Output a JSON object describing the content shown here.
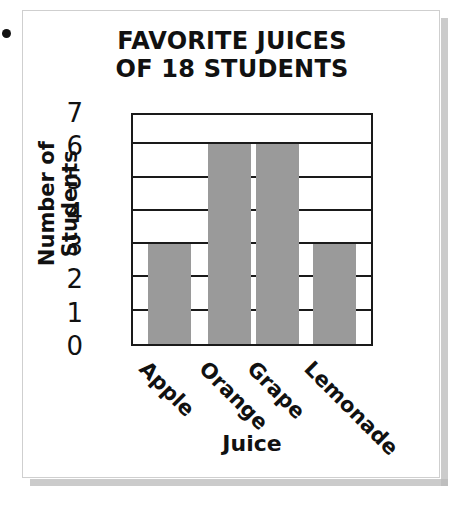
{
  "bullet": {
    "name": "bullet-dot"
  },
  "card": {
    "background": "#ffffff",
    "border_color": "#cfcfcf",
    "shadow_color": "#b9b9b9"
  },
  "chart_data": {
    "type": "bar",
    "title": "FAVORITE JUICES OF 18 STUDENTS",
    "title_lines": [
      "FAVORITE JUICES",
      "OF 18 STUDENTS"
    ],
    "categories": [
      "Apple",
      "Orange",
      "Grape",
      "Lemonade"
    ],
    "values": [
      3,
      6,
      6,
      3
    ],
    "xlabel": "Juice",
    "ylabel": "Number of Students",
    "ylabel_lines": [
      "Number of",
      "Students"
    ],
    "ylim": [
      0,
      7
    ],
    "ytick_labels": [
      "7",
      "6",
      "5",
      "4",
      "3",
      "2",
      "1",
      "0"
    ],
    "ytick_values": [
      7,
      6,
      5,
      4,
      3,
      2,
      1,
      0
    ],
    "ytick_step": 1,
    "grid": true,
    "grid_orientation": "horizontal",
    "legend": false,
    "bar_color": "#9a9a9a",
    "axis_color": "#1a1a1a",
    "xtick_rotation_deg": 45,
    "total_students": 18
  }
}
